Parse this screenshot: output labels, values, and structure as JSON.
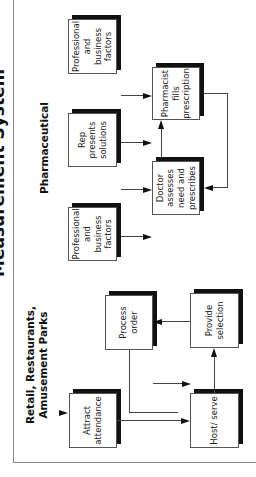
{
  "title": "Measurement System",
  "sections": {
    "retail": {
      "heading": "Retail, Restaurants, Amusement Parks",
      "boxes": {
        "attract": "Attract attendance",
        "process": "Process order",
        "host": "Host/ serve",
        "provide": "Provide selection"
      }
    },
    "pharma": {
      "heading": "Pharmaceutical",
      "boxes": {
        "prof_doctor": "Professional and business factors",
        "rep": "Rep presents solutions",
        "doctor": "Doctor assesses need and prescribes",
        "pharmacist": "Pharmacist fills prescription",
        "prof_pharmacist": "Professional and business factors"
      }
    }
  },
  "colors": {
    "box_border": "#555555",
    "shadow": "#111111",
    "frame": "#888888",
    "arrow": "#111111"
  }
}
